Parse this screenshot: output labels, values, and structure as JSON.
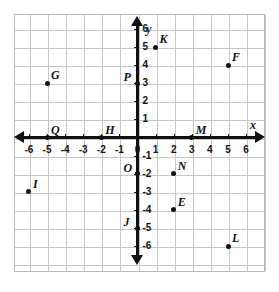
{
  "chart_data": {
    "type": "scatter",
    "title": "",
    "xlabel": "x",
    "ylabel": "y",
    "xlim": [
      -7,
      7
    ],
    "ylim": [
      -7,
      7
    ],
    "grid": true,
    "legend": "none",
    "x_ticks": [
      -6,
      -5,
      -4,
      -3,
      -2,
      -1,
      0,
      1,
      2,
      3,
      4,
      5,
      6
    ],
    "y_ticks": [
      6,
      5,
      4,
      3,
      2,
      1,
      -1,
      -2,
      -3,
      -4,
      -5,
      -6
    ],
    "x_tick_labels": [
      "-6",
      "-5",
      "-4",
      "-3",
      "-2",
      "-1",
      "0",
      "1",
      "2",
      "3",
      "4",
      "5",
      "6"
    ],
    "y_tick_labels": [
      "6",
      "5",
      "4",
      "3",
      "2",
      "1",
      "-1",
      "-2",
      "-3",
      "-4",
      "-5",
      "-6"
    ],
    "points": [
      {
        "label": "K",
        "x": 1,
        "y": 5,
        "label_pos": "up-right"
      },
      {
        "label": "F",
        "x": 5,
        "y": 4,
        "label_pos": "up-right"
      },
      {
        "label": "G",
        "x": -5,
        "y": 3,
        "label_pos": "up-right"
      },
      {
        "label": "P",
        "x": 0,
        "y": 3,
        "label_pos": "left"
      },
      {
        "label": "Q",
        "x": -5,
        "y": 0,
        "label_pos": "up-right"
      },
      {
        "label": "H",
        "x": -2,
        "y": 0,
        "label_pos": "up-right"
      },
      {
        "label": "M",
        "x": 3,
        "y": 0,
        "label_pos": "up-right"
      },
      {
        "label": "O",
        "x": 0,
        "y": -2,
        "label_pos": "left"
      },
      {
        "label": "N",
        "x": 2,
        "y": -2,
        "label_pos": "up-right"
      },
      {
        "label": "I",
        "x": -6,
        "y": -3,
        "label_pos": "up-right"
      },
      {
        "label": "E",
        "x": 2,
        "y": -4,
        "label_pos": "up-right"
      },
      {
        "label": "J",
        "x": 0,
        "y": -5,
        "label_pos": "left"
      },
      {
        "label": "L",
        "x": 5,
        "y": -6,
        "label_pos": "up-right"
      }
    ]
  },
  "axes": {
    "x_axis_label": "x",
    "y_axis_label": "y"
  },
  "colors": {
    "axis": "#111111",
    "grid": "#c6c6c6",
    "frame": "#b9b9b9",
    "point": "#111111",
    "background": "#ffffff"
  }
}
